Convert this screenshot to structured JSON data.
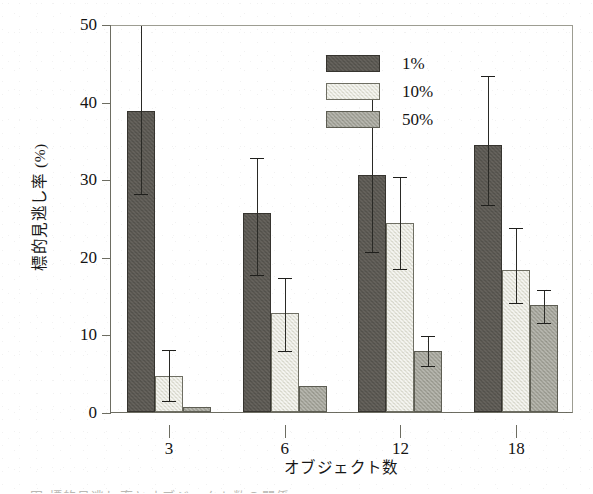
{
  "chart_data": {
    "type": "bar",
    "title": "",
    "xlabel": "オブジェクト数",
    "ylabel": "標的見逃し率 (%)",
    "categories": [
      "3",
      "6",
      "12",
      "18"
    ],
    "ylim": [
      0,
      50
    ],
    "yticks": [
      0,
      10,
      20,
      30,
      40,
      50
    ],
    "ytick_labels": [
      "0",
      "10",
      "20",
      "30",
      "40",
      "50"
    ],
    "grid": false,
    "legend_position": "top-center",
    "series": [
      {
        "name": "1%",
        "color": "#595650",
        "values": [
          38.8,
          25.6,
          30.6,
          34.4
        ],
        "err_low": [
          28.2,
          17.8,
          20.8,
          26.8
        ],
        "err_high": [
          52.0,
          33.0,
          41.0,
          43.5
        ],
        "err_high_clipped": [
          true,
          false,
          false,
          false
        ]
      },
      {
        "name": "10%",
        "color": "#e3e3d9",
        "values": [
          4.7,
          12.8,
          24.4,
          18.3
        ],
        "err_low": [
          1.6,
          8.0,
          18.6,
          14.2
        ],
        "err_high": [
          8.2,
          17.5,
          30.5,
          24.0
        ],
        "err_high_clipped": [
          false,
          false,
          false,
          false
        ]
      },
      {
        "name": "50%",
        "color": "#a0a096",
        "values": [
          0.6,
          3.4,
          7.9,
          13.8
        ],
        "err_low": [
          null,
          null,
          6.0,
          11.6
        ],
        "err_high": [
          null,
          null,
          10.0,
          16.0
        ],
        "err_high_clipped": [
          false,
          false,
          false,
          false
        ]
      }
    ]
  },
  "legend": {
    "items": [
      {
        "label": "1%",
        "swatch": "#595650"
      },
      {
        "label": "10%",
        "swatch": "#e3e3d9"
      },
      {
        "label": "50%",
        "swatch": "#a0a096"
      }
    ]
  },
  "caption_sliver": "図  標的見逃し率とオブジェクト数の関係"
}
